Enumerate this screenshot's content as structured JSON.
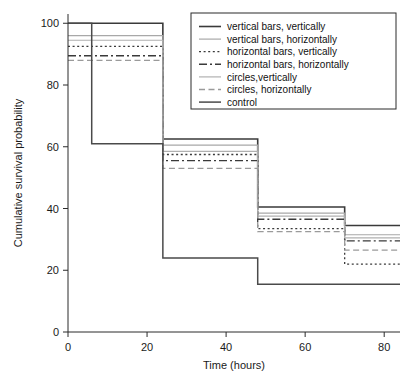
{
  "chart_data": {
    "type": "line",
    "title": "",
    "xlabel": "Time (hours)",
    "ylabel": "Cumulative survival probability",
    "xlim": [
      0,
      84
    ],
    "ylim": [
      0,
      103
    ],
    "xticks": [
      0,
      20,
      40,
      60,
      80
    ],
    "yticks": [
      0,
      20,
      40,
      60,
      80,
      100
    ],
    "grid": false,
    "legend_position": "upper-right",
    "step_style": "post",
    "series": [
      {
        "name": "vertical bars, vertically",
        "linestyle": "solid",
        "color": "#3a3a3a",
        "width": 1.6,
        "x": [
          0,
          24,
          48,
          70,
          84
        ],
        "y": [
          100,
          62.5,
          40.5,
          34.5,
          34.5
        ]
      },
      {
        "name": "vertical bars, horizontally",
        "linestyle": "solid-light",
        "color": "#a8a8a8",
        "width": 1.2,
        "x": [
          0,
          24,
          48,
          70,
          84
        ],
        "y": [
          96,
          60.5,
          38.5,
          31.5,
          31.5
        ]
      },
      {
        "name": "horizontal bars, vertically",
        "linestyle": "dotted",
        "color": "#3a3a3a",
        "width": 1.3,
        "x": [
          0,
          24,
          48,
          70,
          84
        ],
        "y": [
          92.5,
          57.5,
          33.5,
          22.0,
          22.0
        ]
      },
      {
        "name": "horizontal bars, horizontally",
        "linestyle": "dashdot",
        "color": "#3a3a3a",
        "width": 1.4,
        "x": [
          0,
          24,
          48,
          70,
          84
        ],
        "y": [
          89.5,
          55.5,
          36.5,
          29.5,
          29.5
        ]
      },
      {
        "name": "circles,vertically",
        "linestyle": "solid-light",
        "color": "#b0b0b0",
        "width": 1.2,
        "x": [
          0,
          24,
          48,
          70,
          84
        ],
        "y": [
          94.5,
          58.5,
          37.5,
          30.5,
          30.5
        ]
      },
      {
        "name": "circles, horizontally",
        "linestyle": "dashed",
        "color": "#9a9a9a",
        "width": 1.3,
        "x": [
          0,
          24,
          48,
          70,
          84
        ],
        "y": [
          88.0,
          53.0,
          32.5,
          26.5,
          26.5
        ]
      },
      {
        "name": "control",
        "linestyle": "solid",
        "color": "#4a4a4a",
        "width": 1.5,
        "x": [
          0,
          6,
          24,
          48,
          84
        ],
        "y": [
          100,
          61.0,
          24.0,
          15.5,
          15.5
        ]
      }
    ]
  },
  "axes": {
    "xlabel": "Time (hours)",
    "ylabel": "Cumulative survival probability",
    "xtick_labels": [
      "0",
      "20",
      "40",
      "60",
      "80"
    ],
    "ytick_labels": [
      "0",
      "20",
      "40",
      "60",
      "80",
      "100"
    ]
  },
  "legend": {
    "entries": [
      {
        "label": "vertical bars, vertically"
      },
      {
        "label": "vertical bars, horizontally"
      },
      {
        "label": "horizontal bars, vertically"
      },
      {
        "label": "horizontal bars, horizontally"
      },
      {
        "label": "circles,vertically"
      },
      {
        "label": "circles, horizontally"
      },
      {
        "label": "control"
      }
    ]
  },
  "colors": {
    "axis": "#2b2b2b",
    "dark_line": "#3a3a3a",
    "light_line": "#a8a8a8",
    "background": "#ffffff"
  }
}
